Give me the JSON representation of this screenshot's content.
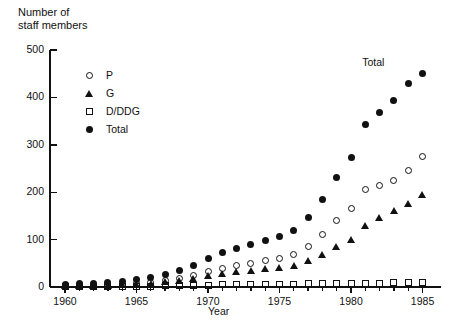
{
  "chart_data": {
    "type": "scatter",
    "title": "",
    "ylabel": "Number of\nstaff members",
    "xlabel": "Year",
    "xlim": [
      1959.3,
      1985.8
    ],
    "ylim": [
      0,
      500
    ],
    "yticks": [
      0,
      100,
      200,
      300,
      400,
      500
    ],
    "ytick_labels": [
      "0",
      "100",
      "200",
      "300",
      "400",
      "500"
    ],
    "xticks": [
      1960,
      1965,
      1970,
      1975,
      1980,
      1985
    ],
    "xtick_labels": [
      "1960",
      "1965",
      "1970",
      "1975",
      "1980",
      "1985"
    ],
    "x_minor_every": 1,
    "grid": false,
    "legend_position": "upper-left-inside",
    "x": [
      1960,
      1961,
      1962,
      1963,
      1964,
      1965,
      1966,
      1967,
      1968,
      1969,
      1970,
      1971,
      1972,
      1973,
      1974,
      1975,
      1976,
      1977,
      1978,
      1979,
      1980,
      1981,
      1982,
      1983,
      1984,
      1985
    ],
    "series": [
      {
        "name": "P",
        "marker": "open-circle",
        "values": [
          3,
          4,
          4,
          5,
          6,
          8,
          10,
          13,
          18,
          24,
          33,
          40,
          45,
          50,
          55,
          60,
          68,
          85,
          110,
          140,
          165,
          205,
          215,
          225,
          245,
          275
        ]
      },
      {
        "name": "G",
        "marker": "filled-triangle",
        "values": [
          2,
          2,
          3,
          3,
          4,
          5,
          7,
          10,
          14,
          18,
          24,
          28,
          32,
          35,
          38,
          40,
          45,
          55,
          68,
          85,
          100,
          130,
          145,
          160,
          175,
          195
        ]
      },
      {
        "name": "D/DDG",
        "marker": "open-square",
        "values": [
          1,
          1,
          1,
          1,
          2,
          2,
          2,
          3,
          3,
          4,
          4,
          5,
          5,
          5,
          6,
          6,
          6,
          7,
          7,
          7,
          8,
          8,
          8,
          9,
          9,
          10
        ]
      },
      {
        "name": "Total",
        "marker": "filled-circle",
        "values": [
          6,
          7,
          8,
          9,
          12,
          15,
          19,
          26,
          35,
          46,
          61,
          73,
          82,
          90,
          99,
          106,
          119,
          147,
          185,
          232,
          273,
          343,
          368,
          394,
          429,
          450
        ]
      }
    ],
    "annotations": [
      {
        "text": "Total",
        "x": 1984.0,
        "y": 473
      }
    ]
  }
}
